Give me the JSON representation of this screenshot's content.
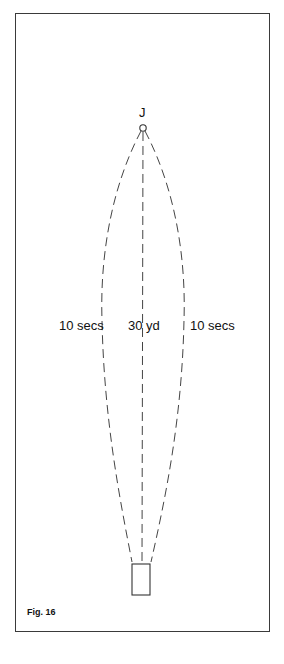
{
  "figure": {
    "caption": "Fig. 16",
    "start_marker_label": "J",
    "left_path_label": "10 secs",
    "center_distance_label": "30 yd",
    "right_path_label": "10 secs"
  },
  "colors": {
    "line": "#444444",
    "frame": "#3a3a3a",
    "text": "#111111"
  }
}
